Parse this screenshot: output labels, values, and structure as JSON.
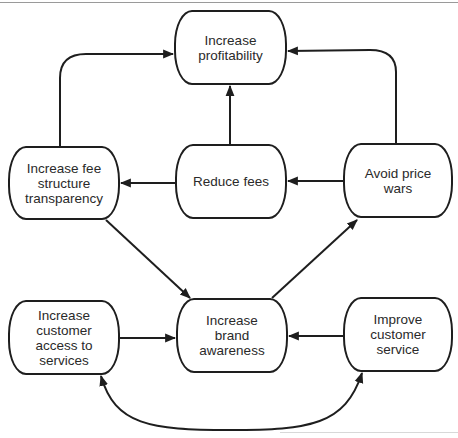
{
  "diagram": {
    "type": "flow-diagram",
    "nodes": [
      {
        "id": "increase-profitability",
        "label": "Increase\nprofitability",
        "x": 174,
        "y": 10,
        "w": 113,
        "h": 75
      },
      {
        "id": "increase-fee-structure-transparency",
        "label": "Increase fee\nstructure\ntransparency",
        "x": 8,
        "y": 146,
        "w": 112,
        "h": 74
      },
      {
        "id": "reduce-fees",
        "label": "Reduce fees",
        "x": 175,
        "y": 144,
        "w": 112,
        "h": 75
      },
      {
        "id": "avoid-price-wars",
        "label": "Avoid price\nwars",
        "x": 343,
        "y": 143,
        "w": 110,
        "h": 75
      },
      {
        "id": "increase-customer-access",
        "label": "Increase\ncustomer\naccess to\nservices",
        "x": 8,
        "y": 300,
        "w": 112,
        "h": 75
      },
      {
        "id": "increase-brand-awareness",
        "label": "Increase\nbrand\nawareness",
        "x": 176,
        "y": 298,
        "w": 112,
        "h": 75
      },
      {
        "id": "improve-customer-service",
        "label": "Improve\ncustomer\nservice",
        "x": 343,
        "y": 297,
        "w": 110,
        "h": 75
      }
    ],
    "edges": [
      {
        "from": "increase-fee-structure-transparency",
        "to": "increase-profitability",
        "style": "curved-elbow"
      },
      {
        "from": "reduce-fees",
        "to": "increase-profitability",
        "style": "straight"
      },
      {
        "from": "avoid-price-wars",
        "to": "increase-profitability",
        "style": "curved-elbow"
      },
      {
        "from": "reduce-fees",
        "to": "increase-fee-structure-transparency",
        "style": "straight"
      },
      {
        "from": "avoid-price-wars",
        "to": "reduce-fees",
        "style": "straight"
      },
      {
        "from": "increase-fee-structure-transparency",
        "to": "increase-brand-awareness",
        "style": "diagonal"
      },
      {
        "from": "increase-brand-awareness",
        "to": "avoid-price-wars",
        "style": "diagonal"
      },
      {
        "from": "increase-customer-access",
        "to": "increase-brand-awareness",
        "style": "straight"
      },
      {
        "from": "improve-customer-service",
        "to": "increase-brand-awareness",
        "style": "straight"
      },
      {
        "from": "increase-customer-access",
        "to": "improve-customer-service",
        "style": "curved-bidirectional"
      }
    ],
    "colors": {
      "stroke": "#1e1e1e",
      "text": "#2a2a2a",
      "background": "#ffffff"
    }
  }
}
